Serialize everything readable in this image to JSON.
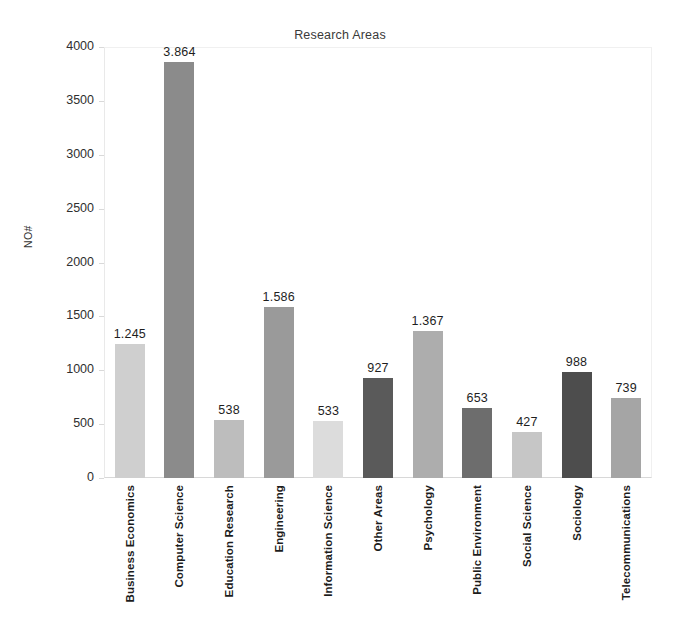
{
  "chart_data": {
    "type": "bar",
    "title": "Research Areas",
    "xlabel": "",
    "ylabel": "NO#",
    "ylim": [
      0,
      4000
    ],
    "grid": false,
    "legend": "none",
    "y_ticks": [
      4000,
      3500,
      3000,
      2500,
      2000,
      1500,
      1000,
      500,
      0
    ],
    "y_tick_labels": [
      "4000",
      "3500",
      "3000",
      "2500",
      "2000",
      "1500",
      "1000",
      "500",
      "0"
    ],
    "categories": [
      "Business Economics",
      "Computer Science",
      "Education Research",
      "Engineering",
      "Information Science",
      "Other Areas",
      "Psychology",
      "Public Environment",
      "Social Science",
      "Sociology",
      "Telecommunications"
    ],
    "values": [
      1245,
      3864,
      538,
      1586,
      533,
      927,
      1367,
      653,
      427,
      988,
      739
    ],
    "value_labels": [
      "1.245",
      "3.864",
      "538",
      "1.586",
      "533",
      "927",
      "1.367",
      "653",
      "427",
      "988",
      "739"
    ],
    "bar_colors": [
      "#cfcfcf",
      "#8b8b8b",
      "#bdbdbd",
      "#9a9a9a",
      "#dcdcdc",
      "#5a5a5a",
      "#adadad",
      "#6d6d6d",
      "#c6c6c6",
      "#4d4d4d",
      "#a5a5a5"
    ]
  }
}
